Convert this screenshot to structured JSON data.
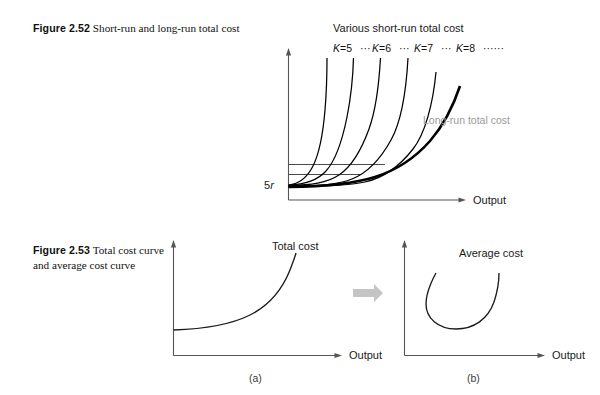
{
  "figures": [
    {
      "id": "2.52",
      "number_label": "Figure 2.52",
      "caption_text": "Short-run and long-run total cost",
      "chart": {
        "type": "line",
        "title": "Various short-run total cost",
        "xlabel": "Output",
        "ylabel": "",
        "y_axis_tick_label": "5r",
        "long_run_label": "Long-run total cost",
        "series_labels": [
          "K=5",
          "K=6",
          "K=7",
          "K=8"
        ],
        "series_separator": "···",
        "series_trailing": "······",
        "short_run_curve_count": 5,
        "fixed_cost_line_count": 2,
        "grid": false,
        "legend_position": "inline-above-curves",
        "description": "Family of short-run total cost curves, each beginning at its own fixed-cost level and rising steeply; the thick long-run total cost curve is the lower envelope of the family."
      }
    },
    {
      "id": "2.53",
      "number_label": "Figure 2.53",
      "caption_text": "Total cost curve and average cost curve",
      "transition_icon": "right-block-arrow-icon",
      "panels": [
        {
          "key": "a",
          "sublabel": "(a)",
          "chart": {
            "type": "line",
            "curve_label": "Total cost",
            "xlabel": "Output",
            "ylabel": "",
            "shape": "increasing-convex-from-positive-intercept",
            "grid": false
          }
        },
        {
          "key": "b",
          "sublabel": "(b)",
          "chart": {
            "type": "line",
            "curve_label": "Average cost",
            "xlabel": "Output",
            "ylabel": "",
            "shape": "u-shaped",
            "grid": false
          }
        }
      ]
    }
  ],
  "colors": {
    "page_background": "#ffffff",
    "ink": "#111111",
    "axis": "#555555",
    "long_run_gray_text": "#9a9a9a",
    "block_arrow": "#c4c4c4"
  }
}
